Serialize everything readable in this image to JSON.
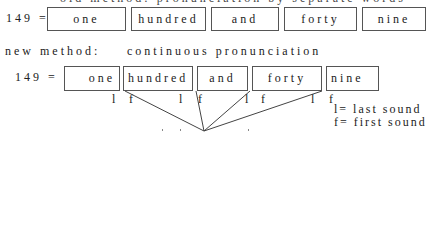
{
  "top_cutoff_text": "old method: pronunciation by separate words",
  "row1": {
    "label": "149 =",
    "words": [
      "one",
      "hundred",
      "and",
      "forty",
      "nine"
    ]
  },
  "new_method": {
    "label": "new method:",
    "caption": "continuous pronunciation"
  },
  "row2": {
    "label": "149 =",
    "words": [
      "one",
      "hundred",
      "and",
      "forty",
      "nine"
    ],
    "markers": [
      {
        "symbol": "l",
        "meaning": "last"
      },
      {
        "symbol": "f",
        "meaning": "first"
      },
      {
        "symbol": "l",
        "meaning": "last"
      },
      {
        "symbol": "f",
        "meaning": "first"
      },
      {
        "symbol": "l",
        "meaning": "last"
      },
      {
        "symbol": "f",
        "meaning": "first"
      },
      {
        "symbol": "l",
        "meaning": "last"
      },
      {
        "symbol": "f",
        "meaning": "first"
      }
    ]
  },
  "legend": {
    "last": "l= last sound",
    "first": "f= first sound"
  },
  "colors": {
    "line": "#444444",
    "text": "#222222",
    "background": "#ffffff"
  }
}
